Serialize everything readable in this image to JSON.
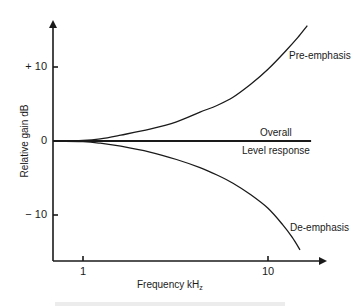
{
  "chart_data": {
    "type": "line",
    "title": "",
    "xlabel": "Frequency kHz",
    "xlabel_main": "Frequency kH",
    "xlabel_sub": "z",
    "ylabel": "Relative gain dB",
    "x_scale": "log",
    "xlim": [
      0.69,
      20.0
    ],
    "ylim": [
      -16.0,
      17.0
    ],
    "grid": false,
    "legend": "inline-labels",
    "x_ticks": [
      {
        "value": 1,
        "label": "1"
      },
      {
        "value": 10,
        "label": "10"
      }
    ],
    "y_ticks": [
      {
        "value": 10,
        "label": "+ 10"
      },
      {
        "value": 0,
        "label": "0"
      },
      {
        "value": -10,
        "label": "− 10"
      }
    ],
    "series": [
      {
        "name": "Pre-emphasis",
        "x": [
          0.69,
          1.0,
          1.24,
          1.6,
          2.3,
          3.2,
          4.29,
          5.3,
          6.47,
          8.0,
          10.0,
          12.5,
          14.5,
          16.3
        ],
        "y": [
          0.0,
          0.1,
          0.3,
          0.8,
          1.6,
          2.6,
          3.9,
          4.8,
          5.9,
          7.6,
          9.7,
          12.2,
          14.0,
          15.6
        ]
      },
      {
        "name": "Overall",
        "x": [
          0.69,
          17.1
        ],
        "y": [
          0.0,
          0.0
        ]
      },
      {
        "name": "De-emphasis",
        "x": [
          0.69,
          1.0,
          1.24,
          1.6,
          2.3,
          3.2,
          4.29,
          5.3,
          6.47,
          8.0,
          10.0,
          12.0,
          13.5,
          14.9
        ],
        "y": [
          0.0,
          -0.1,
          -0.3,
          -0.7,
          -1.5,
          -2.5,
          -3.6,
          -4.6,
          -5.7,
          -7.2,
          -9.1,
          -11.3,
          -13.0,
          -14.7
        ]
      }
    ],
    "annotations": [
      {
        "text": "Pre-emphasis",
        "series": "Pre-emphasis"
      },
      {
        "text": "Overall",
        "series": "Overall",
        "position": "above"
      },
      {
        "text": "Level response",
        "series": "Overall",
        "position": "below"
      },
      {
        "text": "De-emphasis",
        "series": "De-emphasis"
      }
    ]
  }
}
